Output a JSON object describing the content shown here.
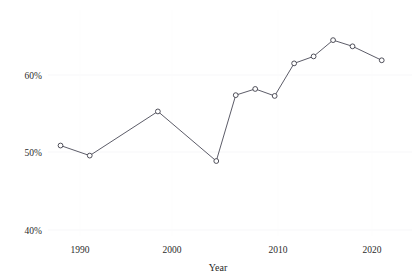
{
  "chart_data": {
    "type": "line",
    "title": "",
    "subtitle": "",
    "xlabel": "Year",
    "ylabel": "",
    "xlim": [
      1985,
      2024
    ],
    "ylim": [
      40,
      67
    ],
    "grid": false,
    "legend": "none",
    "x_ticks": [
      1990,
      2000,
      2010,
      2020
    ],
    "x_tick_labels": [
      "1990",
      "2000",
      "2010",
      "2020"
    ],
    "y_ticks": [
      40,
      50,
      60
    ],
    "y_tick_labels": [
      "40%",
      "50%",
      "60%"
    ],
    "marker": "open-circle",
    "series": [
      {
        "name": "",
        "color": "#4a4a57",
        "x": [
          1988,
          1991,
          1998,
          2004,
          2006,
          2008,
          2010,
          2012,
          2014,
          2016,
          2018,
          2021
        ],
        "values": [
          50.9,
          49.6,
          55.3,
          48.9,
          57.4,
          58.2,
          57.3,
          61.5,
          62.4,
          64.5,
          63.7,
          61.9
        ]
      }
    ]
  },
  "axes": {
    "x_title": "Year",
    "y_title": ""
  }
}
